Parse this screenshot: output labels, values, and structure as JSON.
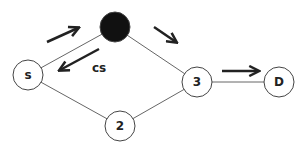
{
  "diagram": {
    "nodes": [
      {
        "id": "S",
        "label": "s",
        "x": 28,
        "y": 75,
        "r": 15,
        "fill": "#ffffff"
      },
      {
        "id": "1",
        "label": "",
        "x": 115,
        "y": 27,
        "r": 15,
        "fill": "#111111"
      },
      {
        "id": "3",
        "label": "3",
        "x": 197,
        "y": 82,
        "r": 15,
        "fill": "#ffffff"
      },
      {
        "id": "D",
        "label": "D",
        "x": 279,
        "y": 82,
        "r": 15,
        "fill": "#ffffff"
      },
      {
        "id": "2",
        "label": "2",
        "x": 120,
        "y": 126,
        "r": 15,
        "fill": "#ffffff"
      }
    ],
    "edges": [
      {
        "from": "S",
        "to": "1"
      },
      {
        "from": "1",
        "to": "3"
      },
      {
        "from": "3",
        "to": "D"
      },
      {
        "from": "S",
        "to": "2"
      },
      {
        "from": "2",
        "to": "3"
      }
    ],
    "arrows": [
      {
        "name": "arrow-s-to-node1",
        "x1": 47,
        "y1": 42,
        "x2": 78,
        "y2": 28
      },
      {
        "name": "arrow-node1-to-s",
        "x1": 99,
        "y1": 49,
        "x2": 60,
        "y2": 70
      },
      {
        "name": "arrow-node1-to-3",
        "x1": 154,
        "y1": 27,
        "x2": 176,
        "y2": 42
      },
      {
        "name": "arrow-3-to-d",
        "x1": 222,
        "y1": 71,
        "x2": 258,
        "y2": 71
      }
    ],
    "annotation": {
      "label": "cs",
      "x": 92,
      "y": 72
    }
  }
}
